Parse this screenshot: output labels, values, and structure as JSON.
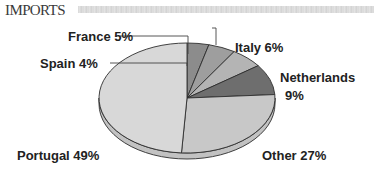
{
  "header": {
    "title": "IMPORTS"
  },
  "labels": {
    "france": "France 5%",
    "spain": "Spain 4%",
    "italy": "Italy 6%",
    "netherlands_name": "Netherlands",
    "netherlands_pct": "9%",
    "portugal": "Portugal 49%",
    "other": "Other 27%"
  },
  "colors": {
    "spain": "#8c8c8c",
    "france": "#9e9e9e",
    "italy": "#b4b4b4",
    "netherlands": "#6e6e6e",
    "other": "#c8c8c8",
    "portugal": "#d8d8d8",
    "rim": "#c2c2c2",
    "outline": "#2e2e2e",
    "leader": "#444444"
  },
  "chart_data": {
    "type": "pie",
    "title": "IMPORTS",
    "style": "3d-pie",
    "categories": [
      "Spain",
      "France",
      "Italy",
      "Netherlands",
      "Other",
      "Portugal"
    ],
    "values": [
      4,
      5,
      6,
      9,
      27,
      49
    ],
    "units": "%",
    "start_angle_deg": 0,
    "direction": "clockwise",
    "legend": "none (direct labels with leader lines)"
  }
}
